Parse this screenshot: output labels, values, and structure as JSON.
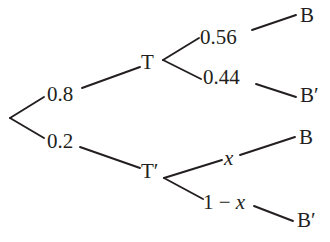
{
  "diagram": {
    "type": "probability-tree",
    "stroke_color": "#231f20",
    "background_color": "#ffffff",
    "nodes": [
      {
        "id": "root",
        "label": "",
        "x": 10,
        "y": 118
      },
      {
        "id": "t",
        "label": "T",
        "x": 148,
        "y": 62
      },
      {
        "id": "t_prime",
        "label": "T′",
        "x": 150,
        "y": 172
      },
      {
        "id": "b_top",
        "label": "B",
        "x": 307,
        "y": 16
      },
      {
        "id": "b_prime_top",
        "label": "B′",
        "x": 308,
        "y": 96
      },
      {
        "id": "b_bottom",
        "label": "B",
        "x": 306,
        "y": 138
      },
      {
        "id": "b_prime_bottom",
        "label": "B′",
        "x": 305,
        "y": 221
      }
    ],
    "edges": [
      {
        "id": "root-t",
        "from": "root",
        "to": "t",
        "label": "0.8"
      },
      {
        "id": "root-tprime",
        "from": "root",
        "to": "t_prime",
        "label": "0.2"
      },
      {
        "id": "t-b",
        "from": "t",
        "to": "b_top",
        "label": "0.56"
      },
      {
        "id": "t-bprime",
        "from": "t",
        "to": "b_prime_top",
        "label": "0.44"
      },
      {
        "id": "tprime-b",
        "from": "t_prime",
        "to": "b_bottom",
        "label": "x"
      },
      {
        "id": "tprime-bprime",
        "from": "t_prime",
        "to": "b_prime_bottom",
        "label": "1 − x"
      }
    ]
  },
  "labels": {
    "node_t": "T",
    "node_t_prime": "T′",
    "node_b_top": "B",
    "node_b_prime_top": "B′",
    "node_b_bottom": "B",
    "node_b_prime_bottom": "B′",
    "prob_t": "0.8",
    "prob_t_prime": "0.2",
    "prob_b_given_t": "0.56",
    "prob_b_prime_given_t": "0.44",
    "prob_b_given_t_prime": "x",
    "prob_b_prime_given_t_prime_prefix": "1 − ",
    "prob_b_prime_given_t_prime_var": "x"
  }
}
